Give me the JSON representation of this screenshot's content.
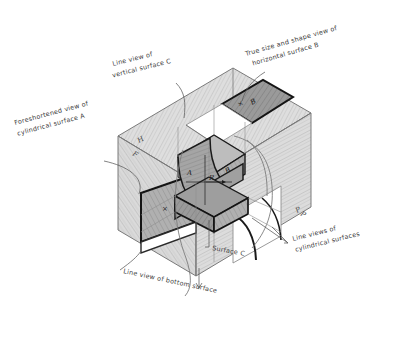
{
  "figure": {
    "type": "descriptive-geometry-glass-box",
    "background": "#ffffff",
    "ink": "#3a3a3a",
    "dark_face": "#8e8e8e",
    "mid_face": "#a8a8a8",
    "light_face": "#c9c9c9",
    "plane_tint": "#d7d7d7"
  },
  "annotations": {
    "line_view_vertical_c": {
      "line1": "Line  view  of",
      "line2": "vertical surface C"
    },
    "true_size_b": {
      "line1": "True size and shape view of",
      "line2": "horizontal  surface B"
    },
    "foreshortened_a": {
      "line1": "Foreshortened  view of",
      "line2": "cylindrical  surface A"
    },
    "line_view_bottom": {
      "line1": "Line view of bottom surface"
    },
    "surface_c": {
      "line1": "Surface C"
    },
    "line_views_cylindrical": {
      "line1": "Line views of",
      "line2": "cylindrical surfaces"
    }
  },
  "plane_labels": {
    "horizontal": "H",
    "frontal": "F",
    "profile": "P",
    "profile_right": "P"
  },
  "surface_labels": {
    "surface_a": "A",
    "surface_b": "B",
    "surface_b_front": "B",
    "radius": "R",
    "bottom_mark": "×",
    "front_mark": "×",
    "top_mark": "×"
  }
}
